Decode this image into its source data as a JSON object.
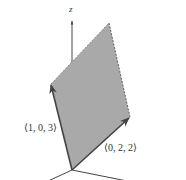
{
  "diagram": {
    "axis_label_z": "z",
    "vector_a": {
      "label": "⟨1, 0, 3⟩",
      "components": [
        1,
        0,
        3
      ]
    },
    "vector_b": {
      "label": "⟨0, 2, 2⟩",
      "components": [
        0,
        2,
        2
      ]
    },
    "colors": {
      "fill": "#a9a9a9",
      "edge": "#555555",
      "axis": "#444444",
      "text": "#333333"
    }
  }
}
